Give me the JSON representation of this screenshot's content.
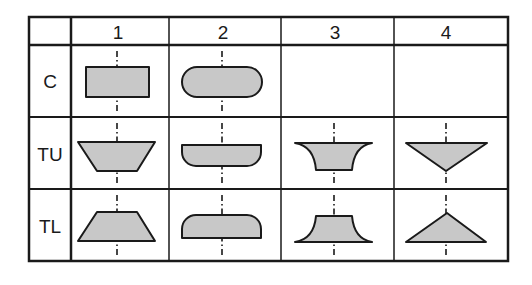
{
  "table": {
    "corner": "",
    "columns": [
      "1",
      "2",
      "3",
      "4"
    ],
    "rows": [
      {
        "label": "C",
        "shapes": [
          "rectangle",
          "stadium",
          "",
          ""
        ]
      },
      {
        "label": "TU",
        "shapes": [
          "inverted-trapezoid",
          "half-stadium-bottom-round",
          "concave-inverted-trapezoid",
          "inverted-triangle"
        ]
      },
      {
        "label": "TL",
        "shapes": [
          "trapezoid",
          "half-stadium-top-round",
          "concave-trapezoid",
          "triangle"
        ]
      }
    ]
  },
  "colors": {
    "line": "#1a1a1a",
    "shape_fill": "#c8c8c8",
    "background": "#ffffff"
  }
}
